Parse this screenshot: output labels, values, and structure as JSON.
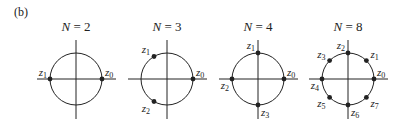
{
  "panel_label": "(b)",
  "diagrams": [
    {
      "title_var": "N",
      "title_eq": " = ",
      "title_num": "2",
      "n": 2,
      "points": [
        {
          "k": 0,
          "label": "z",
          "sub": "0"
        },
        {
          "k": 1,
          "label": "z",
          "sub": "1"
        }
      ]
    },
    {
      "title_var": "N",
      "title_eq": " = ",
      "title_num": "3",
      "n": 3,
      "points": [
        {
          "k": 0,
          "label": "z",
          "sub": "0"
        },
        {
          "k": 1,
          "label": "z",
          "sub": "1"
        },
        {
          "k": 2,
          "label": "z",
          "sub": "2"
        }
      ]
    },
    {
      "title_var": "N",
      "title_eq": " = ",
      "title_num": "4",
      "n": 4,
      "points": [
        {
          "k": 0,
          "label": "z",
          "sub": "0"
        },
        {
          "k": 1,
          "label": "z",
          "sub": "1"
        },
        {
          "k": 2,
          "label": "z",
          "sub": "2"
        },
        {
          "k": 3,
          "label": "z",
          "sub": "3"
        }
      ]
    },
    {
      "title_var": "N",
      "title_eq": " = ",
      "title_num": "8",
      "n": 8,
      "points": [
        {
          "k": 0,
          "label": "z",
          "sub": "0"
        },
        {
          "k": 1,
          "label": "z",
          "sub": "1"
        },
        {
          "k": 2,
          "label": "z",
          "sub": "2"
        },
        {
          "k": 3,
          "label": "z",
          "sub": "3"
        },
        {
          "k": 4,
          "label": "z",
          "sub": "4"
        },
        {
          "k": 5,
          "label": "z",
          "sub": "5"
        },
        {
          "k": 6,
          "label": "z",
          "sub": "6"
        },
        {
          "k": 7,
          "label": "z",
          "sub": "7"
        }
      ]
    }
  ],
  "colors": {
    "ink": "#222222"
  }
}
